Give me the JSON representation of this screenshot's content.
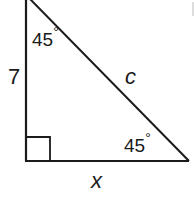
{
  "diagram": {
    "type": "right-triangle",
    "top_angle": "45",
    "bottom_angle": "45",
    "degree_symbol": "°",
    "vertical_leg_label": "7",
    "hypotenuse_label": "c",
    "horizontal_leg_label": "x",
    "right_angle_marker": true,
    "stroke_color": "#1a1a1a"
  }
}
